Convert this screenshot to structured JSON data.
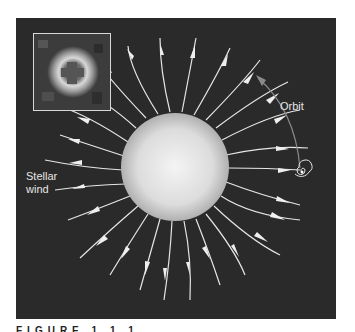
{
  "figure": {
    "labels": {
      "orbit": "Orbit",
      "stellar_wind_line1": "Stellar",
      "stellar_wind_line2": "wind"
    },
    "caption": "FIGURE 1.1.1",
    "colors": {
      "background": "#2a2a2a",
      "star_center": "#f2f2f2",
      "star_edge": "#bdbdbd",
      "flow_lines": "#e8e8e8",
      "orbit_arc": "#8a8a8a",
      "page": "#ffffff"
    },
    "inset": {
      "description": "observed image of ring-shaped emission around a dark cross-shaped center"
    },
    "star": {
      "cx": 175,
      "cy": 167,
      "r": 54
    },
    "wind_lines_count": 26,
    "icons": {
      "orbit_arrow": "arrow-up-left",
      "planet_spiral": "spiral"
    }
  }
}
